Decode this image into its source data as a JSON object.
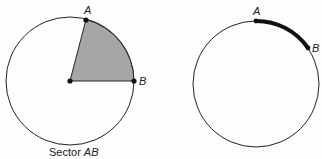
{
  "figures": [
    {
      "name": "sector-figure",
      "center": {
        "x": 70,
        "y": 81
      },
      "radius": 64,
      "point_a": {
        "label": "A",
        "x": 86,
        "y": 21
      },
      "point_b": {
        "label": "B",
        "x": 134,
        "y": 81
      },
      "fill_color": "#a6a6a6",
      "caption_prefix": "Sector ",
      "caption_italic": "AB"
    },
    {
      "name": "arc-figure",
      "center": {
        "x": 256,
        "y": 84
      },
      "radius": 63,
      "point_a": {
        "label": "A",
        "x": 256,
        "y": 21
      },
      "point_b": {
        "label": "B",
        "x": 308,
        "y": 48
      },
      "arc_color": "#111111"
    }
  ]
}
